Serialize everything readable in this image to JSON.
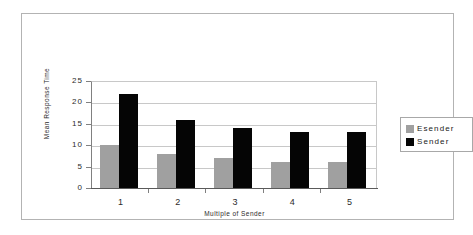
{
  "chart_data": {
    "type": "bar",
    "title": "",
    "subtitle": "",
    "xlabel": "Multiple of Sender",
    "ylabel": "Mean Response Time",
    "categories": [
      "1",
      "2",
      "3",
      "4",
      "5"
    ],
    "series": [
      {
        "name": "Esender",
        "color": "#a0a0a0",
        "values": [
          10,
          8,
          7,
          6,
          6
        ]
      },
      {
        "name": "Sender",
        "color": "#050505",
        "values": [
          22,
          16,
          14,
          13,
          13
        ]
      }
    ],
    "ylim": [
      0,
      25
    ],
    "ytick_labels": [
      "25",
      "20",
      "15",
      "10",
      "5",
      "0"
    ],
    "ytick_values": [
      25,
      20,
      15,
      10,
      5,
      0
    ],
    "grid": true,
    "legend_position": "right"
  },
  "legend": {
    "items": [
      {
        "label": "Esender",
        "color": "#a0a0a0"
      },
      {
        "label": "Sender",
        "color": "#050505"
      }
    ]
  },
  "axes": {
    "y_title": "Mean Response Time",
    "x_title": "Multiple of Sender"
  },
  "colors": {
    "esender": "#a0a0a0",
    "sender": "#050505",
    "gridline": "#c8c8c8",
    "axis": "#808080",
    "frame": "#b3b3b3",
    "background": "#ffffff"
  }
}
